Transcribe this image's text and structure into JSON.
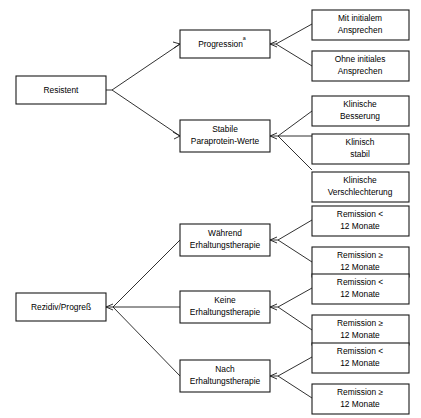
{
  "diagram": {
    "type": "flowchart-tree",
    "orientation": "left-to-right",
    "language": "de",
    "background_color": "#ffffff",
    "line_color": "#1a1a1a",
    "box_fill_color": "#ffffff",
    "trees": [
      {
        "id": "tree-resistent",
        "root": {
          "id": "resistent",
          "label": "Resistent"
        },
        "level2": [
          {
            "id": "progression",
            "label": "Progression",
            "superscript": "a",
            "children": [
              {
                "id": "mit-initialem-ansprechen",
                "line1": "Mit initialem",
                "line2": "Ansprechen"
              },
              {
                "id": "ohne-initiales-ansprechen",
                "line1": "Ohne initiales",
                "line2": "Ansprechen"
              }
            ]
          },
          {
            "id": "stabile-paraprotein-werte",
            "line1": "Stabile",
            "line2": "Paraprotein-Werte",
            "children": [
              {
                "id": "klinische-besserung",
                "line1": "Klinische",
                "line2": "Besserung"
              },
              {
                "id": "klinisch-stabil",
                "line1": "Klinisch",
                "line2": "stabil"
              },
              {
                "id": "klinische-verschlechterung",
                "line1": "Klinische",
                "line2": "Verschlechterung"
              }
            ]
          }
        ]
      },
      {
        "id": "tree-rezidiv",
        "root": {
          "id": "rezidiv-progress",
          "label": "Rezidiv/Progreß"
        },
        "level2": [
          {
            "id": "waehrend-erhaltungstherapie",
            "line1": "Während",
            "line2": "Erhaltungstherapie",
            "children": [
              {
                "id": "remission-lt-12-a",
                "line1": "Remission <",
                "line2": "12 Monate"
              },
              {
                "id": "remission-ge-12-a",
                "line1": "Remission ≥",
                "line2": "12 Monate"
              }
            ]
          },
          {
            "id": "keine-erhaltungstherapie",
            "line1": "Keine",
            "line2": "Erhaltungstherapie",
            "children": [
              {
                "id": "remission-lt-12-b",
                "line1": "Remission <",
                "line2": "12 Monate"
              },
              {
                "id": "remission-ge-12-b",
                "line1": "Remission ≥",
                "line2": "12 Monate"
              }
            ]
          },
          {
            "id": "nach-erhaltungstherapie",
            "line1": "Nach",
            "line2": "Erhaltungstherapie",
            "children": [
              {
                "id": "remission-lt-12-c",
                "line1": "Remission <",
                "line2": "12 Monate"
              },
              {
                "id": "remission-ge-12-c",
                "line1": "Remission ≥",
                "line2": "12 Monate"
              }
            ]
          }
        ]
      }
    ],
    "labels": {
      "resistent": "Resistent",
      "progression": "Progression",
      "progression_sup": "a",
      "stabile_l1": "Stabile",
      "stabile_l2": "Paraprotein-Werte",
      "mit_initialem_l1": "Mit initialem",
      "mit_initialem_l2": "Ansprechen",
      "ohne_initiales_l1": "Ohne initiales",
      "ohne_initiales_l2": "Ansprechen",
      "klin_besserung_l1": "Klinische",
      "klin_besserung_l2": "Besserung",
      "klin_stabil_l1": "Klinisch",
      "klin_stabil_l2": "stabil",
      "klin_verschl_l1": "Klinische",
      "klin_verschl_l2": "Verschlechterung",
      "rezidiv": "Rezidiv/Progreß",
      "waehrend_l1": "Während",
      "waehrend_l2": "Erhaltungstherapie",
      "keine_l1": "Keine",
      "keine_l2": "Erhaltungstherapie",
      "nach_l1": "Nach",
      "nach_l2": "Erhaltungstherapie",
      "rem_lt_a_l1": "Remission <",
      "rem_lt_a_l2": "12 Monate",
      "rem_ge_a_l1": "Remission ≥",
      "rem_ge_a_l2": "12 Monate",
      "rem_lt_b_l1": "Remission <",
      "rem_lt_b_l2": "12 Monate",
      "rem_ge_b_l1": "Remission ≥",
      "rem_ge_b_l2": "12 Monate",
      "rem_lt_c_l1": "Remission <",
      "rem_lt_c_l2": "12 Monate",
      "rem_ge_c_l1": "Remission ≥",
      "rem_ge_c_l2": "12 Monate"
    }
  }
}
